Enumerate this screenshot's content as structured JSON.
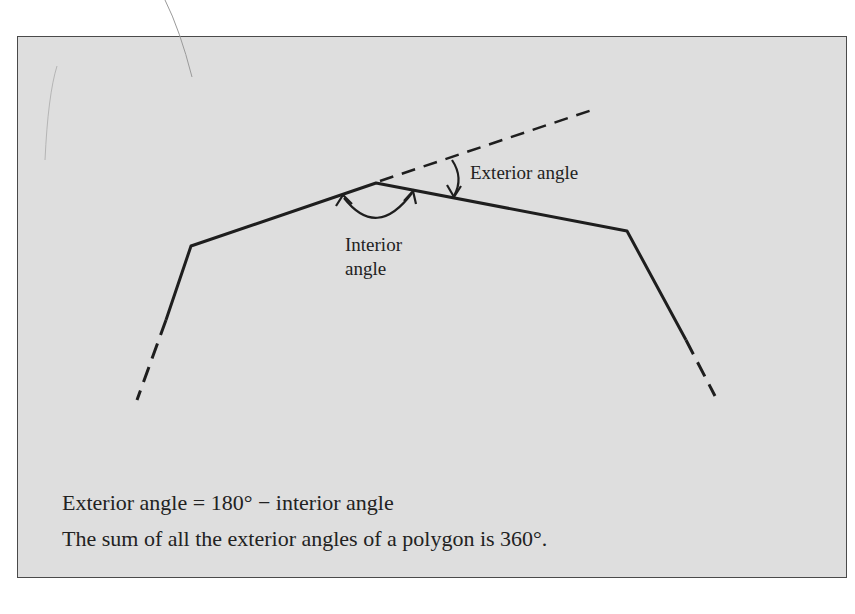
{
  "diagram": {
    "labels": {
      "exterior_angle": "Exterior angle",
      "interior_angle_line1": "Interior",
      "interior_angle_line2": "angle"
    },
    "formulas": {
      "line1": "Exterior angle = 180° − interior angle",
      "line2": "The sum of all the exterior angles of a polygon is 360°."
    },
    "colors": {
      "panel_background": "#dedede",
      "panel_border": "#4a4a4a",
      "line": "#1e1e1e"
    }
  }
}
